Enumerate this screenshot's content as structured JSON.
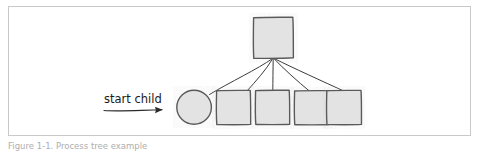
{
  "figure": {
    "caption": "Figure 1-1.  Process tree example",
    "frame": {
      "stroke": "#c9c9c9"
    },
    "background": "#ffffff"
  },
  "diagram": {
    "type": "hand-drawn-node-graph",
    "style": "sketch",
    "colors": {
      "node_fill": "#e3e3e3",
      "node_stroke": "#5a5a5a",
      "edge_stroke": "#3b3b3b",
      "text": "#1a1a1a"
    },
    "annotation": {
      "label": "start child",
      "arrow": "arrow-right"
    },
    "nodes": [
      {
        "id": "parent",
        "shape": "square",
        "label": "",
        "x": 273,
        "y": 37,
        "w": 40,
        "h": 41
      },
      {
        "id": "child-circle",
        "shape": "circle",
        "label": "",
        "x": 194,
        "y": 107,
        "w": 33,
        "h": 34
      },
      {
        "id": "child-1",
        "shape": "square",
        "label": "",
        "x": 233,
        "y": 107,
        "w": 34,
        "h": 34
      },
      {
        "id": "child-2",
        "shape": "square",
        "label": "",
        "x": 272,
        "y": 107,
        "w": 34,
        "h": 34
      },
      {
        "id": "child-3",
        "shape": "square",
        "label": "",
        "x": 311,
        "y": 107,
        "w": 34,
        "h": 34
      },
      {
        "id": "child-4",
        "shape": "square",
        "label": "",
        "x": 343,
        "y": 107,
        "w": 34,
        "h": 34
      }
    ],
    "edges": [
      {
        "from": "parent",
        "to": "child-circle"
      },
      {
        "from": "parent",
        "to": "child-1"
      },
      {
        "from": "parent",
        "to": "child-2"
      },
      {
        "from": "parent",
        "to": "child-3"
      },
      {
        "from": "parent",
        "to": "child-4"
      }
    ]
  }
}
